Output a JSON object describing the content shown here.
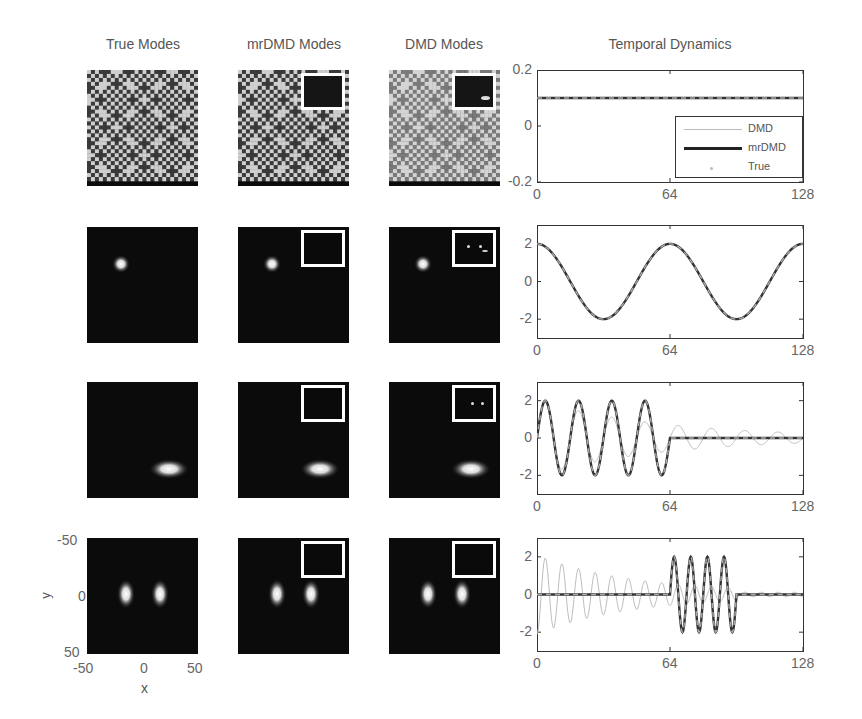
{
  "figure": {
    "column_titles": [
      "True Modes",
      "mrDMD Modes",
      "DMD Modes",
      "Temporal Dynamics"
    ],
    "spatial_axes": {
      "xlabel": "x",
      "ylabel": "y",
      "x_ticks": [
        "-50",
        "0",
        "50"
      ],
      "y_ticks": [
        "-50",
        "0",
        "50"
      ]
    },
    "rows": [
      {
        "name": "background-pattern",
        "true_mode": "checkered-pattern",
        "mrdmd_mode": "checkered-pattern-with-inset",
        "dmd_mode": "checkered-pattern-faded-with-inset"
      },
      {
        "name": "single-spot",
        "true_mode": "gaussian-spot-upper-left",
        "mrdmd_mode": "gaussian-spot-upper-left-with-inset",
        "dmd_mode": "gaussian-spot-upper-left-with-inset"
      },
      {
        "name": "horizontal-ellipse",
        "true_mode": "ellipse-lower-right",
        "mrdmd_mode": "ellipse-lower-right-with-inset",
        "dmd_mode": "ellipse-lower-right-with-inset"
      },
      {
        "name": "twin-spots",
        "true_mode": "two-vertical-spots-center",
        "mrdmd_mode": "two-vertical-spots-with-inset",
        "dmd_mode": "two-vertical-spots-with-inset"
      }
    ],
    "legend": [
      {
        "label": "DMD",
        "style": "thin-light-gray"
      },
      {
        "label": "mrDMD",
        "style": "thick-dark"
      },
      {
        "label": "True",
        "style": "gray-dots"
      }
    ],
    "x_ticks": [
      "0",
      "64",
      "128"
    ],
    "plot_y_ticks": [
      [
        "0.2",
        "0",
        "-0.2"
      ],
      [
        "2",
        "0",
        "-2"
      ],
      [
        "2",
        "0",
        "-2"
      ],
      [
        "2",
        "0",
        "-2"
      ]
    ]
  },
  "chart_data": [
    {
      "type": "line",
      "title": "Temporal Dynamics (mode 1)",
      "xlabel": "",
      "ylabel": "",
      "xlim": [
        0,
        128
      ],
      "ylim": [
        -0.2,
        0.2
      ],
      "x_ticks": [
        0,
        64,
        128
      ],
      "y_ticks": [
        -0.2,
        0,
        0.2
      ],
      "legend_position": "lower right",
      "series": [
        {
          "name": "DMD",
          "description": "constant",
          "value": 0.1
        },
        {
          "name": "mrDMD",
          "description": "constant",
          "value": 0.1
        },
        {
          "name": "True",
          "description": "constant",
          "value": 0.1
        }
      ]
    },
    {
      "type": "line",
      "title": "Temporal Dynamics (mode 2)",
      "xlim": [
        0,
        128
      ],
      "ylim": [
        -3,
        3
      ],
      "x_ticks": [
        0,
        64,
        128
      ],
      "y_ticks": [
        -2,
        0,
        2
      ],
      "series": [
        {
          "name": "DMD",
          "description": "2*cos(2*pi*t/64)",
          "amplitude": 2,
          "period": 64
        },
        {
          "name": "mrDMD",
          "description": "2*cos(2*pi*t/64)",
          "amplitude": 2,
          "period": 64
        },
        {
          "name": "True",
          "description": "2*cos(2*pi*t/64)",
          "amplitude": 2,
          "period": 64
        }
      ]
    },
    {
      "type": "line",
      "title": "Temporal Dynamics (mode 3)",
      "xlim": [
        0,
        128
      ],
      "ylim": [
        -3,
        3
      ],
      "x_ticks": [
        0,
        64,
        128
      ],
      "y_ticks": [
        -2,
        0,
        2
      ],
      "series": [
        {
          "name": "True",
          "description": "2*sin(2*pi*t/16) for t in [0,64], then 0",
          "amplitude": 2,
          "period": 16,
          "active": [
            0,
            64
          ]
        },
        {
          "name": "mrDMD",
          "description": "matches True",
          "amplitude": 2,
          "period": 16,
          "active": [
            0,
            64
          ]
        },
        {
          "name": "DMD",
          "description": "sinusoid period 16 decaying amplitude ~2 to ~0.5 across full range",
          "amplitude_start": 2,
          "amplitude_end": 0.4,
          "period": 16
        }
      ]
    },
    {
      "type": "line",
      "title": "Temporal Dynamics (mode 4)",
      "xlim": [
        0,
        128
      ],
      "ylim": [
        -3,
        3
      ],
      "x_ticks": [
        0,
        64,
        128
      ],
      "y_ticks": [
        -2,
        0,
        2
      ],
      "series": [
        {
          "name": "True",
          "description": "0, then 2*sin(2*pi*t/8) for t in [64,96], then 0",
          "amplitude": 2,
          "period": 8,
          "active": [
            64,
            96
          ]
        },
        {
          "name": "mrDMD",
          "description": "matches True",
          "amplitude": 2,
          "period": 8,
          "active": [
            64,
            96
          ]
        },
        {
          "name": "DMD",
          "description": "oscillation period ~8 decaying from ~2 at t=0 to ~0.3 at t=96",
          "amplitude_start": 2,
          "amplitude_end": 0.3,
          "period": 8
        }
      ]
    }
  ]
}
